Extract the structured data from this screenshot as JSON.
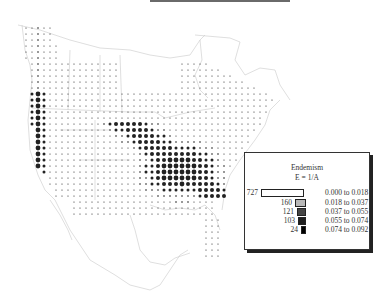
{
  "figure": {
    "type": "dot-map",
    "region": "North America (Canada, United States, Mexico)"
  },
  "legend": {
    "title": "Endemism",
    "formula": "E = 1/A",
    "classes": [
      {
        "count": "727",
        "range": "0.000 to 0.018",
        "color": "#ffffff",
        "dot_radius": 0.6
      },
      {
        "count": "160",
        "range": "0.018 to 0.037",
        "color": "#b8b8b8",
        "dot_radius": 1.0
      },
      {
        "count": "121",
        "range": "0.037 to 0.055",
        "color": "#444444",
        "dot_radius": 1.5
      },
      {
        "count": "103",
        "range": "0.055 to 0.074",
        "color": "#1e1e1e",
        "dot_radius": 2.0
      },
      {
        "count": "24",
        "range": "0.074 to 0.092",
        "color": "#000000",
        "dot_radius": 2.4
      }
    ]
  },
  "chart_data": {
    "type": "heatmap",
    "title": "Endemism E = 1/A",
    "legend_position": "lower right",
    "grid": false,
    "classes": [
      "0.000 to 0.018",
      "0.018 to 0.037",
      "0.037 to 0.055",
      "0.055 to 0.074",
      "0.074 to 0.092"
    ],
    "class_counts": [
      727,
      160,
      121,
      103,
      24
    ],
    "total_cells": 1135
  }
}
